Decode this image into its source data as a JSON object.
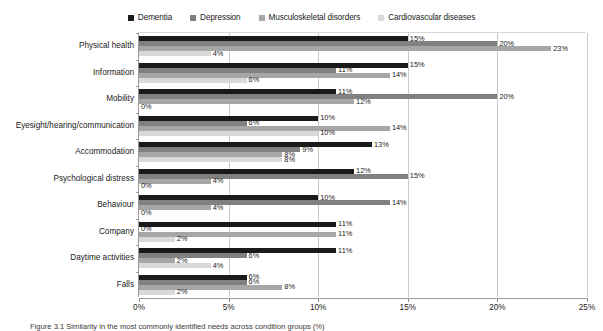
{
  "chart_data": {
    "type": "bar",
    "orientation": "horizontal",
    "title": "",
    "xlabel": "",
    "ylabel": "",
    "xlim": [
      0,
      25
    ],
    "xtick_labels": [
      "0%",
      "5%",
      "10%",
      "15%",
      "20%",
      "25%"
    ],
    "xtick_values": [
      0,
      5,
      10,
      15,
      20,
      25
    ],
    "grid": "vertical",
    "legend_position": "top-center",
    "value_label_suffix": "%",
    "categories": [
      "Physical health",
      "Information",
      "Mobility",
      "Eyesight/hearing/communication",
      "Accommodation",
      "Psychological distress",
      "Behaviour",
      "Company",
      "Daytime activities",
      "Falls"
    ],
    "series": [
      {
        "name": "Dementia",
        "color": "#1a1a1a",
        "values": [
          15,
          15,
          11,
          10,
          13,
          12,
          10,
          11,
          11,
          6
        ],
        "labels": [
          "15%",
          "15%",
          "11%",
          "10%",
          "13%",
          "12%",
          "10%",
          "11%",
          "11%",
          "6%"
        ]
      },
      {
        "name": "Depression",
        "color": "#808080",
        "values": [
          20,
          11,
          20,
          6,
          9,
          15,
          14,
          0,
          6,
          6
        ],
        "labels": [
          "20%",
          "11%",
          "20%",
          "6%",
          "9%",
          "15%",
          "14%",
          "0%",
          "6%",
          "6%"
        ]
      },
      {
        "name": "Musculoskeletal disorders",
        "color": "#a6a6a6",
        "values": [
          23,
          14,
          12,
          14,
          8,
          4,
          4,
          11,
          2,
          8
        ],
        "labels": [
          "23%",
          "14%",
          "12%",
          "14%",
          "8%",
          "4%",
          "4%",
          "11%",
          "2%",
          "8%"
        ]
      },
      {
        "name": "Cardiovascular diseases",
        "color": "#d9d9d9",
        "values": [
          4,
          6,
          0,
          10,
          8,
          0,
          0,
          2,
          4,
          2
        ],
        "labels": [
          "4%",
          "6%",
          "0%",
          "10%",
          "8%",
          "0%",
          "0%",
          "2%",
          "4%",
          "2%"
        ]
      }
    ]
  },
  "caption": {
    "text": "Figure 3.1 Similarity in the most commonly identified needs across condition groups (%)"
  }
}
